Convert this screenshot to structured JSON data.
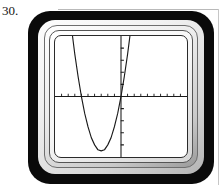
{
  "problem": {
    "number_label": "30."
  },
  "device": {
    "name": "graphing-calculator",
    "body_color": "#0a0a0a",
    "bezel_color": "#e6e6e6",
    "screen_color": "#ffffff"
  },
  "chart_data": {
    "type": "line",
    "title": "",
    "subtitle": "",
    "xlabel": "",
    "ylabel": "",
    "curve_label": "upward-opening parabola",
    "grid": false,
    "legend": null,
    "axis_color": "#1a1a1a",
    "curve_color": "#1a1a1a",
    "xlim": [
      -10,
      10
    ],
    "ylim": [
      -10,
      10
    ],
    "xtick_step": 1,
    "ytick_step": 1,
    "xticks": [
      -9,
      -8,
      -7,
      -6,
      -5,
      -4,
      -3,
      -2,
      -1,
      1,
      2,
      3,
      4,
      5,
      6,
      7,
      8,
      9
    ],
    "yticks": [
      -8,
      -6,
      -4,
      -2,
      2,
      4,
      6,
      8
    ],
    "xtick_labels": [],
    "ytick_labels": [],
    "series": [
      {
        "name": "parabola",
        "equation": "y = (x + 3)^2 - 9",
        "vertex": [
          -3,
          -9
        ],
        "roots": [
          -6,
          0
        ],
        "y_intercept": 0,
        "opens": "up",
        "x": [
          -8.6,
          -8.0,
          -7.5,
          -7.0,
          -6.5,
          -6.0,
          -5.5,
          -5.0,
          -4.5,
          -4.0,
          -3.5,
          -3.0,
          -2.5,
          -2.0,
          -1.5,
          -1.0,
          -0.5,
          0.0,
          0.5,
          1.0,
          1.4
        ],
        "values": [
          22.4,
          16.0,
          11.3,
          7.0,
          3.3,
          0.0,
          -2.8,
          -5.0,
          -6.8,
          -8.0,
          -8.8,
          -9.0,
          -8.8,
          -8.0,
          -6.8,
          -5.0,
          -2.8,
          0.0,
          3.3,
          7.0,
          10.4
        ]
      }
    ]
  }
}
